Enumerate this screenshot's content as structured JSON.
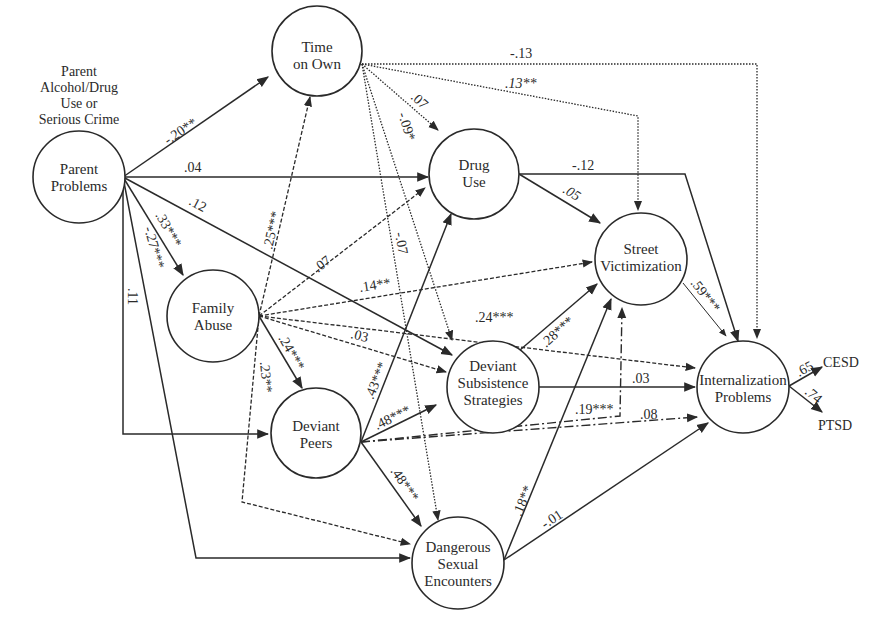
{
  "diagram": {
    "type": "path-model",
    "exogenous_label": [
      "Parent",
      "Alcohol/Drug",
      "Use or",
      "Serious Crime"
    ],
    "nodes": {
      "parent_problems": {
        "lines": [
          "Parent",
          "Problems"
        ]
      },
      "time_on_own": {
        "lines": [
          "Time",
          "on Own"
        ]
      },
      "drug_use": {
        "lines": [
          "Drug",
          "Use"
        ]
      },
      "street_victimization": {
        "lines": [
          "Street",
          "Victimization"
        ]
      },
      "family_abuse": {
        "lines": [
          "Family",
          "Abuse"
        ]
      },
      "deviant_subsistence": {
        "lines": [
          "Deviant",
          "Subsistence",
          "Strategies"
        ]
      },
      "deviant_peers": {
        "lines": [
          "Deviant",
          "Peers"
        ]
      },
      "dangerous_sexual": {
        "lines": [
          "Dangerous",
          "Sexual",
          "Encounters"
        ]
      },
      "internalization": {
        "lines": [
          "Internalization",
          "Problems"
        ]
      }
    },
    "indicators": {
      "cesd": "CESD",
      "ptsd": "PTSD"
    },
    "paths": [
      {
        "from": "Parent Problems",
        "to": "Time on Own",
        "coef": "-.20**"
      },
      {
        "from": "Parent Problems",
        "to": "Drug Use",
        "coef": ".04"
      },
      {
        "from": "Parent Problems",
        "to": "Deviant Subsistence Strategies",
        "coef": ".12"
      },
      {
        "from": "Parent Problems",
        "to": "Family Abuse",
        "coef": ".33***"
      },
      {
        "from": "Parent Problems",
        "to": "Dangerous Sexual Encounters",
        "coef": "-.27***"
      },
      {
        "from": "Parent Problems",
        "to": "Deviant Peers",
        "coef": ".11"
      },
      {
        "from": "Time on Own",
        "to": "Internalization Problems",
        "coef": "-.13"
      },
      {
        "from": "Time on Own",
        "to": "Street Victimization",
        "coef": ".13**"
      },
      {
        "from": "Time on Own",
        "to": "Drug Use",
        "coef": ".07"
      },
      {
        "from": "Time on Own",
        "to": "Deviant Subsistence Strategies",
        "coef": "-.09*"
      },
      {
        "from": "Time on Own",
        "to": "Dangerous Sexual Encounters",
        "coef": "-.07"
      },
      {
        "from": "Drug Use",
        "to": "Internalization Problems",
        "coef": "-.12"
      },
      {
        "from": "Drug Use",
        "to": "Street Victimization",
        "coef": ".05"
      },
      {
        "from": "Street Victimization",
        "to": "Internalization Problems",
        "coef": ".59***"
      },
      {
        "from": "Family Abuse",
        "to": "Time on Own",
        "coef": ".25***"
      },
      {
        "from": "Family Abuse",
        "to": "Drug Use",
        "coef": ".07"
      },
      {
        "from": "Family Abuse",
        "to": "Street Victimization",
        "coef": ".14**"
      },
      {
        "from": "Family Abuse",
        "to": "Internalization Problems",
        "coef": ".24***"
      },
      {
        "from": "Family Abuse",
        "to": "Deviant Subsistence Strategies",
        "coef": ".03"
      },
      {
        "from": "Family Abuse",
        "to": "Deviant Peers",
        "coef": ".24***"
      },
      {
        "from": "Family Abuse",
        "to": "Dangerous Sexual Encounters",
        "coef": ".23**"
      },
      {
        "from": "Deviant Subsistence Strategies",
        "to": "Street Victimization",
        "coef": ".28***"
      },
      {
        "from": "Deviant Subsistence Strategies",
        "to": "Internalization Problems",
        "coef": ".03"
      },
      {
        "from": "Deviant Peers",
        "to": "Drug Use",
        "coef": ".43***"
      },
      {
        "from": "Deviant Peers",
        "to": "Deviant Subsistence Strategies",
        "coef": ".48***"
      },
      {
        "from": "Deviant Peers",
        "to": "Street Victimization",
        "coef": ".19***"
      },
      {
        "from": "Deviant Peers",
        "to": "Internalization Problems",
        "coef": ".08"
      },
      {
        "from": "Deviant Peers",
        "to": "Dangerous Sexual Encounters",
        "coef": ".48***"
      },
      {
        "from": "Dangerous Sexual Encounters",
        "to": "Street Victimization",
        "coef": ".18**"
      },
      {
        "from": "Dangerous Sexual Encounters",
        "to": "Internalization Problems",
        "coef": "-.01"
      },
      {
        "from": "Internalization Problems",
        "to": "CESD",
        "coef": ".65"
      },
      {
        "from": "Internalization Problems",
        "to": "PTSD",
        "coef": ".74"
      }
    ]
  }
}
